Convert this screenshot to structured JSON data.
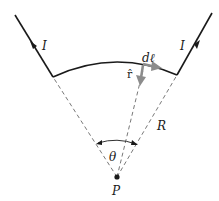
{
  "diagram": {
    "type": "magnetic-field-arc-segment",
    "labels": {
      "current_left": "I",
      "current_right": "I",
      "dl": "dℓ",
      "r_hat": "r̂",
      "radius": "R",
      "angle": "θ",
      "point": "P"
    },
    "colors": {
      "wire": "#1a1a1a",
      "dashed": "#555555",
      "vector": "#8c8c8c",
      "background": "#ffffff"
    }
  }
}
